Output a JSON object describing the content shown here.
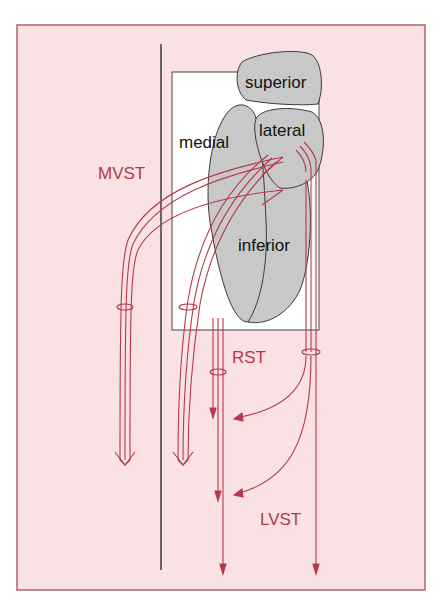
{
  "diagram": {
    "colors": {
      "background": "#f9e1e4",
      "frame_border": "#b5606c",
      "tract": "#b8384a",
      "muscle_fill": "#c8c8c8",
      "muscle_stroke": "#3a3a3a",
      "orbit_box": "#ffffff",
      "midline": "#333333"
    },
    "muscles": {
      "superior": "superior",
      "lateral": "lateral",
      "medial": "medial",
      "inferior": "inferior"
    },
    "tracts": {
      "mvst": "MVST",
      "rst": "RST",
      "lvst": "LVST"
    }
  }
}
